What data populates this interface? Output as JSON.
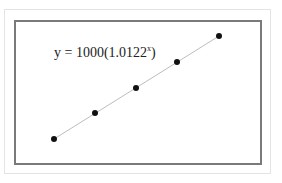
{
  "chart_data": {
    "type": "scatter",
    "title": "",
    "annotation": {
      "base": "y = 1000(1.0122",
      "exponent": "x",
      "close": ")"
    },
    "x": [
      1,
      2,
      3,
      4,
      5
    ],
    "points_px": [
      [
        54,
        139
      ],
      [
        95,
        113
      ],
      [
        136,
        88
      ],
      [
        177,
        62
      ],
      [
        219,
        36
      ]
    ],
    "trendline": "exponential",
    "grid": false,
    "legend": "none",
    "xlabel": "",
    "ylabel": ""
  }
}
